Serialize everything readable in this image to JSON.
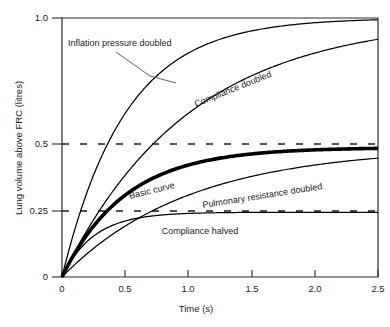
{
  "chart_data": {
    "type": "line",
    "title": "",
    "xlabel": "Time (s)",
    "ylabel": "Lung volume above FRC (litres)",
    "xlim": [
      0,
      2.5
    ],
    "ylim": [
      0,
      1.0
    ],
    "xticks": [
      "0",
      "0.5",
      "1.0",
      "1.5",
      "2.0",
      "2.5"
    ],
    "xtick_values": [
      0,
      0.5,
      1.0,
      1.5,
      2.0,
      2.5
    ],
    "yticks": [
      "0",
      "0.25",
      "0.5",
      "1.0"
    ],
    "ytick_values": [
      0,
      0.25,
      0.5,
      1.0
    ],
    "grid": false,
    "gridlines_dashed": [
      0.25,
      0.5
    ],
    "legend_position": "inline-annotations",
    "series": [
      {
        "name": "Inflation pressure doubled",
        "label": "Inflation pressure doubled",
        "asymptote": 1.0,
        "time_constant": 0.5,
        "linewidth": "thin",
        "x": [
          0,
          0.1,
          0.25,
          0.5,
          0.75,
          1.0,
          1.25,
          1.5,
          1.75,
          2.0,
          2.25,
          2.5
        ],
        "values": [
          0,
          0.18,
          0.39,
          0.63,
          0.78,
          0.86,
          0.92,
          0.95,
          0.97,
          0.98,
          0.99,
          0.99
        ]
      },
      {
        "name": "Compliance doubled",
        "label": "Compliance doubled",
        "asymptote": 1.0,
        "time_constant": 1.0,
        "linewidth": "thin",
        "x": [
          0,
          0.1,
          0.25,
          0.5,
          0.75,
          1.0,
          1.25,
          1.5,
          1.75,
          2.0,
          2.25,
          2.5
        ],
        "values": [
          0,
          0.1,
          0.22,
          0.39,
          0.53,
          0.63,
          0.71,
          0.78,
          0.83,
          0.86,
          0.89,
          0.92
        ]
      },
      {
        "name": "Basic curve",
        "label": "Basic curve",
        "asymptote": 0.5,
        "time_constant": 0.5,
        "linewidth": "thick",
        "x": [
          0,
          0.1,
          0.25,
          0.5,
          0.75,
          1.0,
          1.25,
          1.5,
          1.75,
          2.0,
          2.25,
          2.5
        ],
        "values": [
          0,
          0.09,
          0.2,
          0.32,
          0.39,
          0.43,
          0.46,
          0.47,
          0.48,
          0.48,
          0.48,
          0.48
        ]
      },
      {
        "name": "Pulmonary resistance doubled",
        "label": "Pulmonary resistance doubled",
        "asymptote": 0.5,
        "time_constant": 1.0,
        "linewidth": "thin",
        "x": [
          0,
          0.1,
          0.25,
          0.5,
          0.75,
          1.0,
          1.25,
          1.5,
          1.75,
          2.0,
          2.25,
          2.5
        ],
        "values": [
          0,
          0.05,
          0.11,
          0.2,
          0.26,
          0.32,
          0.36,
          0.39,
          0.41,
          0.43,
          0.44,
          0.45
        ]
      },
      {
        "name": "Compliance halved",
        "label": "Compliance halved",
        "asymptote": 0.25,
        "time_constant": 0.25,
        "linewidth": "thin",
        "x": [
          0,
          0.1,
          0.25,
          0.5,
          0.75,
          1.0,
          1.25,
          1.5,
          1.75,
          2.0,
          2.25,
          2.5
        ],
        "values": [
          0,
          0.1,
          0.16,
          0.21,
          0.235,
          0.243,
          0.247,
          0.249,
          0.25,
          0.25,
          0.25,
          0.25
        ]
      }
    ],
    "annotations": [
      {
        "text": "Inflation pressure doubled",
        "x_px": 68,
        "y_px": 42,
        "rotation": 0,
        "leader": true
      },
      {
        "text": "Compliance doubled",
        "x_px": 196,
        "y_px": 103,
        "rotation": -22,
        "leader": false
      },
      {
        "text": "Basic curve",
        "x_px": 130,
        "y_px": 196,
        "rotation": -14,
        "leader": false
      },
      {
        "text": "Pulmonary resistance doubled",
        "x_px": 203,
        "y_px": 205,
        "rotation": -9,
        "leader": false
      },
      {
        "text": "Compliance halved",
        "x_px": 200,
        "y_px": 231,
        "rotation": 0,
        "leader": false
      }
    ]
  },
  "colors": {
    "axis": "#2b2b2b",
    "curve": "#000000",
    "text": "#1a1a1a",
    "background": "#ffffff"
  }
}
